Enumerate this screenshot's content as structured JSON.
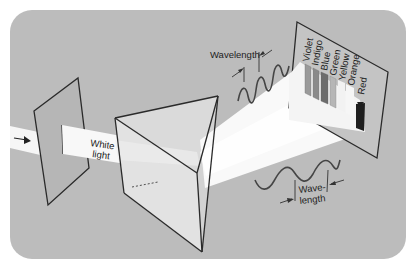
{
  "diagram": {
    "colors": {
      "background_panel": "#bcbcbc",
      "page": "#ffffff",
      "beam": "#f7f7f7",
      "prism_face": "#dcdcdc",
      "line": "#2a2a2a",
      "wave": "#4a4a4a"
    },
    "labels": {
      "white_light_line1": "White",
      "white_light_line2": "light",
      "wavelength_top": "Wavelength",
      "wavelength_bottom_line1": "Wave-",
      "wavelength_bottom_line2": "length"
    },
    "spectrum": {
      "colors": [
        "Violet",
        "Indigo",
        "Blue",
        "Green",
        "Yellow",
        "Orange",
        "Red"
      ],
      "bar_shades": [
        "#9a9a9a",
        "#8a8a8a",
        "#6e6e6e",
        "#b4b4b4",
        "#ffffff",
        "#ffffff",
        "#1e1e1e"
      ]
    },
    "components": [
      "incoming light arrow",
      "slit screen",
      "triangular prism",
      "spectrum screen"
    ]
  }
}
